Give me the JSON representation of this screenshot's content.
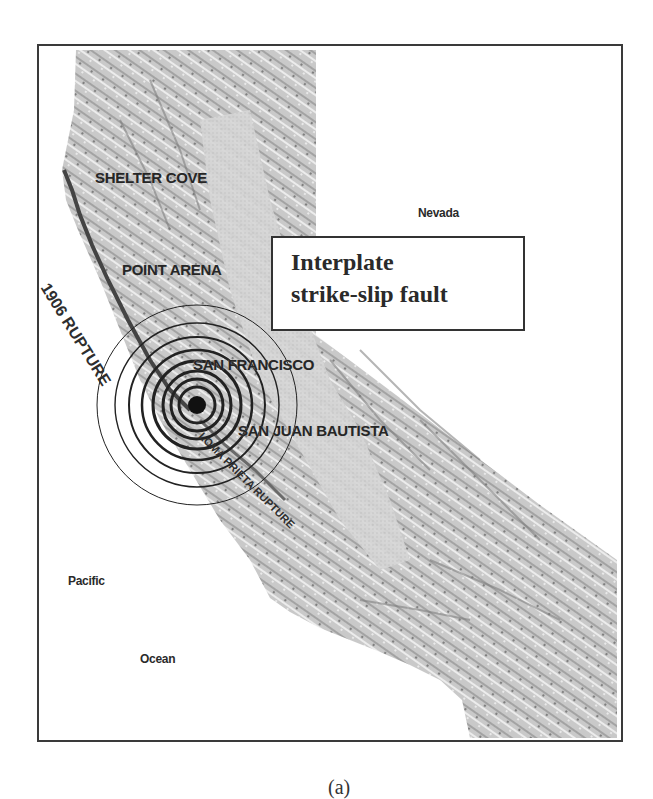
{
  "figure": {
    "caption": "(a)",
    "callout": {
      "line1": "Interplate",
      "line2": "strike-slip fault"
    }
  },
  "map": {
    "labels": {
      "shelter_cove": "SHELTER COVE",
      "point_arena": "POINT ARENA",
      "san_francisco": "SAN FRANCISCO",
      "san_juan_bautista": "SAN JUAN BAUTISTA",
      "nevada": "Nevada",
      "pacific": "Pacific",
      "ocean": "Ocean"
    },
    "ruptures": {
      "rupture_1906": "1906 RUPTURE",
      "loma_prieta": "LOMA PRIETA RUPTURE"
    },
    "epicenter": {
      "x": 197,
      "y": 405
    },
    "ring_radii": [
      100,
      82,
      68,
      55,
      44,
      34,
      26,
      18
    ],
    "colors": {
      "terrain": "#c8c8c8",
      "terrain_dark": "#8a8a8a",
      "valley": "#d8d8d8",
      "ocean": "#ffffff",
      "rupture_line": "#444444",
      "frame": "#3a3a3a"
    }
  }
}
